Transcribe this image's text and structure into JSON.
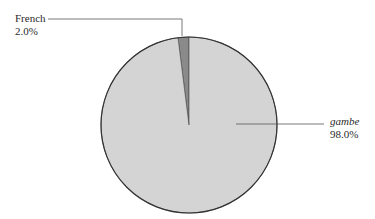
{
  "chart_data": {
    "type": "pie",
    "title": "",
    "categories": [
      "French",
      "gambe"
    ],
    "values": [
      2.0,
      98.0
    ],
    "labels": [
      {
        "name": "French",
        "percent": "2.0%",
        "italic": false
      },
      {
        "name": "gambe",
        "percent": "98.0%",
        "italic": true
      }
    ],
    "colors": {
      "French": "#8a8a8a",
      "gambe": "#d4d4d4",
      "outline": "#333333",
      "leader": "#555555"
    },
    "legend": "none",
    "start_angle_deg": 0,
    "direction": "counterclockwise-from-top"
  }
}
